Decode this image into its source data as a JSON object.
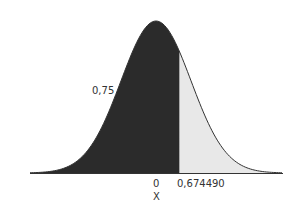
{
  "chart_data": {
    "type": "area",
    "title": "",
    "xlabel": "X",
    "ylabel": "",
    "distribution": "standard normal",
    "x_ticks": [
      "0",
      "0,674490"
    ],
    "shaded_region": {
      "from": "-inf",
      "to": 0.67449,
      "area": 0.75,
      "area_label": "0,75"
    },
    "unshaded_region": {
      "from": 0.67449,
      "to": "+inf"
    },
    "xlim": [
      -3.5,
      3.5
    ],
    "grid": false,
    "legend": "none"
  },
  "labels": {
    "area": "0,75",
    "zero": "0",
    "quantile": "0,674490",
    "xaxis": "X"
  },
  "colors": {
    "shaded": "#2b2b2b",
    "unshaded": "#e8e8e8",
    "curve": "#333333",
    "axis": "#333333"
  }
}
